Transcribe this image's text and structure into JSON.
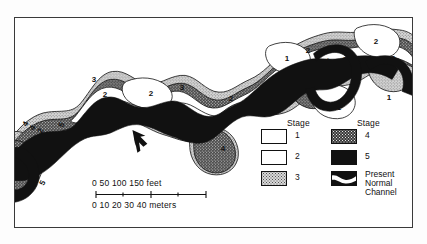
{
  "figure": {
    "type": "geomorphic-map"
  },
  "legend": {
    "columns": [
      {
        "header": "Stage",
        "items": [
          {
            "label": "1",
            "pattern": "white"
          },
          {
            "label": "2",
            "pattern": "white"
          },
          {
            "label": "3",
            "pattern": "light-stipple"
          }
        ]
      },
      {
        "header": "Stage",
        "items": [
          {
            "label": "4",
            "pattern": "dark-stipple"
          },
          {
            "label": "5",
            "pattern": "solid-black"
          },
          {
            "label": "Present\nNormal\nChannel",
            "label_lines": [
              "Present",
              "Normal",
              "Channel"
            ],
            "pattern": "channel-band"
          }
        ]
      }
    ]
  },
  "scale": {
    "feet": {
      "text": "0    50  100  150 feet",
      "ticks": [
        "0",
        "50",
        "100",
        "150"
      ],
      "unit": "feet"
    },
    "meters": {
      "text": "0  10 20 30 40 meters",
      "ticks": [
        "0",
        "10",
        "20",
        "30",
        "40"
      ],
      "unit": "meters"
    }
  },
  "map_labels": [
    {
      "text": "4",
      "x": 11,
      "y": 106,
      "rot": -62
    },
    {
      "text": "4",
      "x": 18,
      "y": 110,
      "rot": -62
    },
    {
      "text": "2",
      "x": 26,
      "y": 113,
      "rot": -62
    },
    {
      "text": "1",
      "x": 30,
      "y": 124,
      "rot": -62
    },
    {
      "text": "5",
      "x": 47,
      "y": 107,
      "rot": -62
    },
    {
      "text": "2",
      "x": 10,
      "y": 138,
      "rot": -62
    },
    {
      "text": "4",
      "x": 19,
      "y": 158,
      "rot": -62
    },
    {
      "text": "5",
      "x": 28,
      "y": 165,
      "rot": -62
    },
    {
      "text": "3",
      "x": 79,
      "y": 62,
      "rot": 0
    },
    {
      "text": "2",
      "x": 90,
      "y": 77,
      "rot": 0
    },
    {
      "text": "1",
      "x": 93,
      "y": 100,
      "rot": 0
    },
    {
      "text": "2",
      "x": 136,
      "y": 76,
      "rot": 0
    },
    {
      "text": "3",
      "x": 167,
      "y": 70,
      "rot": 0
    },
    {
      "text": "1",
      "x": 167,
      "y": 113,
      "rot": 0
    },
    {
      "text": "2",
      "x": 185,
      "y": 106,
      "rot": 0
    },
    {
      "text": "2",
      "x": 216,
      "y": 81,
      "rot": 0
    },
    {
      "text": "4",
      "x": 208,
      "y": 131,
      "rot": 0
    },
    {
      "text": "3",
      "x": 247,
      "y": 70,
      "rot": 0
    },
    {
      "text": "3",
      "x": 280,
      "y": 55,
      "rot": 0
    },
    {
      "text": "1",
      "x": 272,
      "y": 41,
      "rot": 0
    },
    {
      "text": "2",
      "x": 293,
      "y": 33,
      "rot": 0
    },
    {
      "text": "5",
      "x": 316,
      "y": 30,
      "rot": -62
    },
    {
      "text": "4",
      "x": 315,
      "y": 43,
      "rot": -62
    },
    {
      "text": "3",
      "x": 330,
      "y": 42,
      "rot": 0
    },
    {
      "text": "2",
      "x": 323,
      "y": 57,
      "rot": 0
    },
    {
      "text": "1",
      "x": 324,
      "y": 90,
      "rot": 0
    },
    {
      "text": "2",
      "x": 361,
      "y": 24,
      "rot": 0
    },
    {
      "text": "3",
      "x": 378,
      "y": 41,
      "rot": 0
    },
    {
      "text": "1",
      "x": 374,
      "y": 80,
      "rot": 0
    }
  ],
  "colors": {
    "stage1": "#ffffff",
    "stage2": "#ffffff",
    "stage3": "#d8d8d8",
    "stage4": "#3a3a3a",
    "stage5": "#111111",
    "outline": "#111111",
    "frame": "#3a3a3a",
    "background": "#ffffff"
  }
}
